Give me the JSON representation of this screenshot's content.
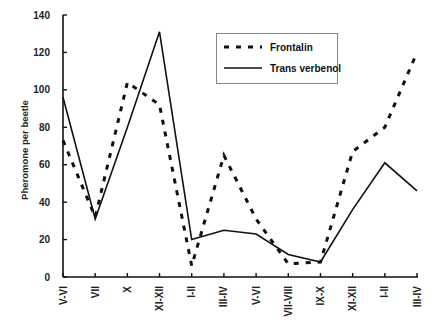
{
  "chart_data": {
    "type": "line",
    "title": "",
    "xlabel": "",
    "ylabel": "Pheromone per beetle",
    "ylim": [
      0,
      140
    ],
    "yticks": [
      0,
      20,
      40,
      60,
      80,
      100,
      120,
      140
    ],
    "grid": false,
    "legend_position": "upper center (boxed)",
    "categories": [
      "V-VI",
      "VII",
      "X",
      "XI-XII",
      "I-II",
      "III-IV",
      "V-VI",
      "VII-VIII",
      "IX-X",
      "XI-XII",
      "I-II",
      "III-IV"
    ],
    "series": [
      {
        "name": "Frontalin",
        "style": "dashed",
        "color": "#111111",
        "values": [
          73,
          32,
          104,
          92,
          6,
          65,
          31,
          7,
          8,
          67,
          80,
          120
        ]
      },
      {
        "name": "Trans verbenol",
        "style": "solid",
        "color": "#111111",
        "values": [
          96,
          31,
          80,
          131,
          20,
          25,
          23,
          12,
          8,
          36,
          61,
          46
        ]
      }
    ]
  },
  "legend": {
    "items": [
      {
        "label": "Frontalin",
        "style": "dashed"
      },
      {
        "label": "Trans verbenol",
        "style": "solid"
      }
    ]
  }
}
